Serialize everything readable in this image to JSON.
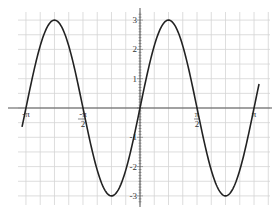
{
  "chart_data": {
    "type": "line",
    "title": "",
    "function": "y = 3 sin(2x)",
    "xlabel": "",
    "ylabel": "",
    "xlim": [
      -3.36,
      3.57
    ],
    "ylim": [
      -3.3,
      3.3
    ],
    "grid": true,
    "x_ticks": [
      {
        "value": -3.14159,
        "label": "-π"
      },
      {
        "value": -1.5708,
        "label": "-π/2"
      },
      {
        "value": 1.5708,
        "label": "π/2"
      },
      {
        "value": 3.14159,
        "label": "π"
      }
    ],
    "y_ticks": [
      {
        "value": 3,
        "label": "3"
      },
      {
        "value": 2,
        "label": "2"
      },
      {
        "value": 1,
        "label": "1"
      },
      {
        "value": -1,
        "label": "-1"
      },
      {
        "value": -2,
        "label": "-2"
      },
      {
        "value": -3,
        "label": "-3"
      }
    ],
    "series": [
      {
        "name": "3 sin(2x)",
        "x_range": [
          -3.25,
          3.28
        ],
        "points": [
          {
            "x": -3.25,
            "y": -0.65
          },
          {
            "x": -3.14159,
            "y": 0
          },
          {
            "x": -2.35619,
            "y": 3
          },
          {
            "x": -1.5708,
            "y": 0
          },
          {
            "x": -0.7854,
            "y": -3
          },
          {
            "x": 0,
            "y": 0
          },
          {
            "x": 0.7854,
            "y": 3
          },
          {
            "x": 1.5708,
            "y": 0
          },
          {
            "x": 2.35619,
            "y": -3
          },
          {
            "x": 3.14159,
            "y": 0
          },
          {
            "x": 3.28,
            "y": 0.82
          }
        ],
        "color": "#222222"
      }
    ],
    "legend": null
  },
  "colors": {
    "grid": "#d4d4d4",
    "axis": "#555555",
    "curve": "#222222"
  }
}
